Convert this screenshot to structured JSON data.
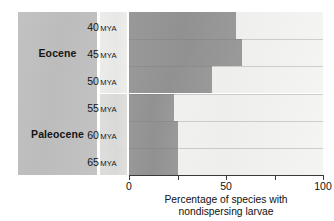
{
  "chart_data": {
    "type": "bar",
    "orientation": "horizontal",
    "stacked": true,
    "title": "",
    "xlabel": "Percentage of species with nondispersing larvae",
    "ylabel": "",
    "xlim": [
      0,
      100
    ],
    "xticks": [
      0,
      25,
      50,
      75,
      100
    ],
    "xtick_labels": [
      "0",
      "",
      "50",
      "",
      "100"
    ],
    "grid": false,
    "legend": "none",
    "categories": [
      "40 MYA",
      "45 MYA",
      "50 MYA",
      "55 MYA",
      "60 MYA",
      "65 MYA"
    ],
    "values": [
      55,
      58,
      43,
      23,
      25,
      25
    ],
    "remainder_values": [
      45,
      42,
      57,
      77,
      75,
      75
    ],
    "series": [
      {
        "name": "nondispersing larvae",
        "values": [
          55,
          58,
          43,
          23,
          25,
          25
        ],
        "color": "#949494"
      },
      {
        "name": "remainder",
        "values": [
          45,
          42,
          57,
          77,
          75,
          75
        ],
        "color": "#f0f0f0"
      }
    ],
    "group_labels": [
      "Eocene",
      "Paleocene"
    ],
    "group_spans": [
      3,
      3
    ]
  },
  "epochs": [
    {
      "label": "Eocene",
      "rows": 3
    },
    {
      "label": "Paleocene",
      "rows": 3
    }
  ],
  "time_axis": {
    "unit": "MYA",
    "rows": [
      {
        "value": "40",
        "unit": "MYA",
        "shade": "light"
      },
      {
        "value": "45",
        "unit": "MYA",
        "shade": "light"
      },
      {
        "value": "50",
        "unit": "MYA",
        "shade": "light"
      },
      {
        "value": "55",
        "unit": "MYA",
        "shade": "dark"
      },
      {
        "value": "60",
        "unit": "MYA",
        "shade": "dark"
      },
      {
        "value": "65",
        "unit": "MYA",
        "shade": "dark"
      }
    ]
  },
  "x_axis": {
    "ticks": [
      {
        "value": 0,
        "label": "0"
      },
      {
        "value": 25,
        "label": ""
      },
      {
        "value": 50,
        "label": "50"
      },
      {
        "value": 75,
        "label": ""
      },
      {
        "value": 100,
        "label": "100"
      }
    ]
  },
  "caption": {
    "line1": "Percentage of species with",
    "line2": "nondispersing larvae"
  },
  "colors": {
    "bar_fill": "#949494",
    "bar_remainder": "#f0f0f0",
    "epoch_panel": "#bfbfbf",
    "mya_light": "#eaeae9",
    "mya_dark": "#dcdcdb",
    "axis": "#3a3a3a",
    "text": "#111111",
    "background": "#ffffff"
  }
}
